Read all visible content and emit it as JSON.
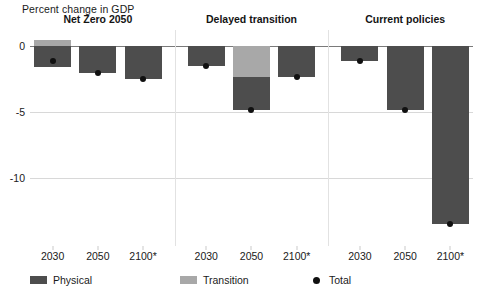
{
  "chart_data": {
    "type": "bar",
    "title": "Percent change in GDP",
    "subtitle": "",
    "xlabel": "",
    "ylabel": "Percent change in GDP",
    "ylim": [
      -15.2,
      1.2
    ],
    "yticks": [
      0,
      -5,
      -10
    ],
    "ytick_labels": [
      "0",
      "-5",
      "-10"
    ],
    "grid": true,
    "stacked": true,
    "legend_position": "bottom",
    "categories": [
      "2030",
      "2050",
      "2100*"
    ],
    "panels": [
      {
        "title": "Net Zero 2050",
        "categories": [
          "2030",
          "2050",
          "2100*"
        ],
        "series": [
          {
            "name": "Physical",
            "color": "#4d4d4d",
            "values": [
              -1.6,
              -2.1,
              -2.5
            ]
          },
          {
            "name": "Transition",
            "color": "#a8a8a8",
            "values": [
              0.45,
              0.0,
              0.0
            ]
          }
        ],
        "total": {
          "name": "Total",
          "color": "#101010",
          "values": [
            -1.15,
            -2.1,
            -2.5
          ]
        }
      },
      {
        "title": "Delayed transition",
        "categories": [
          "2030",
          "2050",
          "2100*"
        ],
        "series": [
          {
            "name": "Physical",
            "color": "#4d4d4d",
            "values": [
              -1.5,
              -2.45,
              -2.4
            ]
          },
          {
            "name": "Transition",
            "color": "#a8a8a8",
            "values": [
              0.0,
              -2.4,
              0.0
            ]
          }
        ],
        "total": {
          "name": "Total",
          "color": "#101010",
          "values": [
            -1.5,
            -4.85,
            -2.4
          ]
        }
      },
      {
        "title": "Current policies",
        "categories": [
          "2030",
          "2050",
          "2100*"
        ],
        "series": [
          {
            "name": "Physical",
            "color": "#4d4d4d",
            "values": [
              -1.15,
              -4.85,
              -13.5
            ]
          },
          {
            "name": "Transition",
            "color": "#a8a8a8",
            "values": [
              0.0,
              0.0,
              0.0
            ]
          }
        ],
        "total": {
          "name": "Total",
          "color": "#101010",
          "values": [
            -1.15,
            -4.85,
            -13.5
          ]
        }
      }
    ],
    "legend": [
      {
        "label": "Physical",
        "color": "#4d4d4d",
        "marker": "square"
      },
      {
        "label": "Transition",
        "color": "#a8a8a8",
        "marker": "square"
      },
      {
        "label": "Total",
        "color": "#101010",
        "marker": "dot"
      }
    ]
  },
  "colors": {
    "physical": "#4d4d4d",
    "transition": "#a8a8a8",
    "total": "#101010",
    "grid": "#d8d8d8",
    "zero_line": "#7a7a7a",
    "background": "#ffffff"
  }
}
